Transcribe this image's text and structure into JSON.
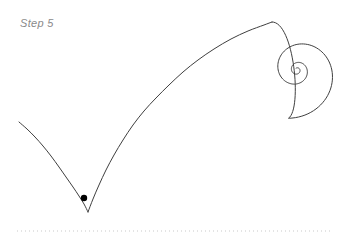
{
  "figure": {
    "step_label": "Step 5",
    "background_color": "#ffffff",
    "curve_color": "#3f3f3f",
    "curve_width": 1,
    "label_color": "#8a8a8a",
    "marker_color": "#000000",
    "baseline_color": "#c9c9c9"
  },
  "chart_data": {
    "type": "line",
    "title": "Step 5",
    "xlabel": "",
    "ylabel": "",
    "xlim": [
      0,
      345
    ],
    "ylim": [
      246,
      0
    ],
    "grid": false,
    "legend": "none",
    "annotations": [
      {
        "name": "step-label",
        "text": "Step 5",
        "x": 20,
        "y": 26
      }
    ],
    "series": [
      {
        "name": "trochoid-left-branch",
        "kind": "curve",
        "points": [
          [
            19,
            122
          ],
          [
            27,
            129
          ],
          [
            35,
            137
          ],
          [
            43,
            146
          ],
          [
            51,
            156
          ],
          [
            59,
            167
          ],
          [
            66,
            177
          ],
          [
            73,
            187
          ],
          [
            79,
            196
          ],
          [
            84,
            204
          ],
          [
            88,
            212
          ]
        ]
      },
      {
        "name": "trochoid-right-branch",
        "kind": "curve",
        "points": [
          [
            88,
            212
          ],
          [
            93,
            199
          ],
          [
            99,
            185
          ],
          [
            106,
            170
          ],
          [
            114,
            155
          ],
          [
            123,
            140
          ],
          [
            133,
            125
          ],
          [
            144,
            111
          ],
          [
            156,
            98
          ],
          [
            169,
            85
          ],
          [
            183,
            72
          ],
          [
            198,
            60
          ],
          [
            214,
            49
          ],
          [
            231,
            39
          ],
          [
            248,
            31
          ],
          [
            264,
            25
          ],
          [
            272,
            22
          ]
        ]
      },
      {
        "name": "spiral-tail",
        "kind": "spiral",
        "center": [
          297,
          70
        ],
        "turns": 2.6,
        "start_radius": 49,
        "end_radius": 2,
        "start_angle_deg": 100,
        "direction": "clockwise-inward",
        "outer_extent_x": 323
      }
    ],
    "markers": [
      {
        "name": "tracing-point",
        "x": 84,
        "y": 198,
        "radius": 3.2,
        "color": "#000000"
      }
    ],
    "baseline": {
      "name": "ground-line",
      "style": "dotted",
      "y": 231,
      "x_start": 17,
      "x_end": 330,
      "dot_size": 1,
      "dot_gap": 3
    }
  }
}
